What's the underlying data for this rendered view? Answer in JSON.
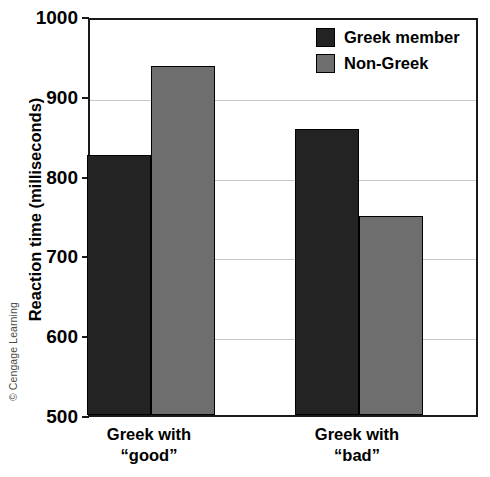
{
  "credit": {
    "text": "© Cengage Learning"
  },
  "chart_data": {
    "type": "bar",
    "title": "",
    "subtitle": "",
    "xlabel": "",
    "ylabel": "Reaction time (milliseconds)",
    "ylim": [
      500,
      1000
    ],
    "yticks": [
      1000,
      900,
      800,
      700,
      600,
      500
    ],
    "ytick_labels": [
      "1000",
      "900",
      "800",
      "700",
      "600",
      "500"
    ],
    "grid": "horizontal",
    "gridlines": [
      900,
      800,
      700,
      600
    ],
    "legend_position": "top-right-inside",
    "categories": [
      "Greek with “good”",
      "Greek with “bad”"
    ],
    "category_lines": [
      {
        "line1": "Greek with",
        "line2": "“good”"
      },
      {
        "line1": "Greek with",
        "line2": "“bad”"
      }
    ],
    "series": [
      {
        "name": "Greek member",
        "color": "#232323",
        "values": [
          826,
          858
        ]
      },
      {
        "name": "Non-Greek",
        "color": "#6e6e6e",
        "values": [
          937,
          749
        ]
      }
    ],
    "colors": {
      "greek_member": "#232323",
      "non_greek": "#6e6e6e",
      "axis": "#1a1a1a",
      "grid": "#c9c9c9",
      "background": "#ffffff"
    }
  }
}
